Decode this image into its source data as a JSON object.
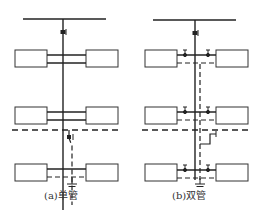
{
  "diagram": {
    "type": "heating-riser-schematic",
    "panels": [
      {
        "id": "a",
        "caption": "(a)单管",
        "pipe_system": "single-pipe",
        "floors": 3,
        "radiators_per_floor": 2
      },
      {
        "id": "b",
        "caption": "(b)双管",
        "pipe_system": "double-pipe",
        "floors": 3,
        "radiators_per_floor": 2
      }
    ],
    "legend": {
      "solid_line": "supply-pipe",
      "dashed_line": "return-pipe"
    },
    "colors": {
      "line": "#222222",
      "radiator_stroke": "#333333",
      "radiator_fill": "#ffffff",
      "background": "#ffffff"
    }
  }
}
